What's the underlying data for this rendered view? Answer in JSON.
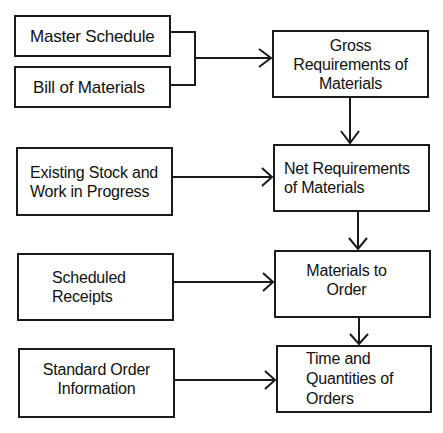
{
  "diagram": {
    "inputs": [
      {
        "id": "master-schedule",
        "label": "Master Schedule"
      },
      {
        "id": "bill-of-materials",
        "label": "Bill of Materials"
      },
      {
        "id": "existing-stock",
        "label": "Existing Stock and\nWork in Progress"
      },
      {
        "id": "scheduled-receipts",
        "label": "Scheduled\nReceipts"
      },
      {
        "id": "standard-order-info",
        "label": "Standard Order\nInformation"
      }
    ],
    "outputs": [
      {
        "id": "gross-requirements",
        "label": "Gross\nRequirements of\nMaterials"
      },
      {
        "id": "net-requirements",
        "label": "Net Requirements\nof Materials"
      },
      {
        "id": "materials-to-order",
        "label": "Materials to\nOrder"
      },
      {
        "id": "time-quantities",
        "label": "Time and\nQuantities of\nOrders"
      }
    ],
    "edges": [
      {
        "from": "master-schedule",
        "to": "gross-requirements"
      },
      {
        "from": "bill-of-materials",
        "to": "gross-requirements"
      },
      {
        "from": "gross-requirements",
        "to": "net-requirements"
      },
      {
        "from": "existing-stock",
        "to": "net-requirements"
      },
      {
        "from": "net-requirements",
        "to": "materials-to-order"
      },
      {
        "from": "scheduled-receipts",
        "to": "materials-to-order"
      },
      {
        "from": "materials-to-order",
        "to": "time-quantities"
      },
      {
        "from": "standard-order-info",
        "to": "time-quantities"
      }
    ],
    "colors": {
      "line": "#1a1a1a",
      "background": "#ffffff"
    }
  }
}
